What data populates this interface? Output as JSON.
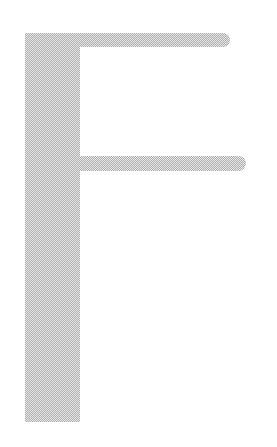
{
  "glyph": {
    "character": "F",
    "color": "#b4b4b4",
    "texture": "stippled"
  }
}
